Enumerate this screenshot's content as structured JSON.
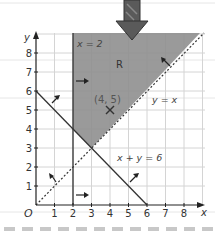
{
  "diagram": {
    "type": "linear-programming-region",
    "axes": {
      "x_label": "x",
      "y_label": "y",
      "origin_label": "O",
      "x_ticks": [
        "1",
        "2",
        "3",
        "4",
        "5",
        "6",
        "7",
        "8"
      ],
      "y_ticks": [
        "1",
        "2",
        "3",
        "4",
        "5",
        "6",
        "7",
        "8"
      ]
    },
    "lines": [
      {
        "label": "x = 2",
        "style": "solid"
      },
      {
        "label": "y = x",
        "style": "dashed"
      },
      {
        "label": "x + y = 6",
        "style": "solid"
      }
    ],
    "region_label": "R",
    "point_label": "(4, 5)",
    "colors": {
      "region": "#8f8f8f",
      "line": "#333333",
      "grid": "#d4d4d4",
      "dash_strip": "#c8c8c8"
    }
  }
}
